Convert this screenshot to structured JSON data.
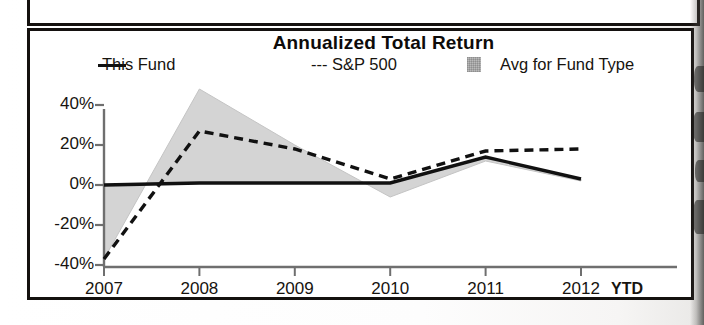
{
  "chart_data": {
    "type": "line",
    "title": "Annualized Total Return",
    "xlabel": "",
    "ylabel": "",
    "categories": [
      "2007",
      "2008",
      "2009",
      "2010",
      "2011",
      "2012"
    ],
    "last_category_note": "YTD",
    "ylim": [
      -40,
      50
    ],
    "yticks": [
      "40%",
      "20%",
      "0%",
      "-20%",
      "-40%"
    ],
    "ytick_values": [
      40,
      20,
      0,
      -20,
      -40
    ],
    "grid": false,
    "legend_position": "top",
    "series": [
      {
        "name": "This Fund",
        "style": "solid",
        "color": "#111111",
        "values": [
          0,
          1,
          1,
          1,
          14,
          3
        ]
      },
      {
        "name": "S&P 500",
        "style": "dashed",
        "color": "#111111",
        "values": [
          -37,
          27,
          18,
          3,
          17,
          18
        ]
      },
      {
        "name": "Avg for Fund Type",
        "style": "shaded-band",
        "color": "#d3d3d3",
        "values": [
          -37,
          48,
          20,
          -6,
          12,
          2
        ]
      }
    ],
    "band_baseline": [
      0,
      1,
      1,
      1,
      14,
      3
    ]
  },
  "legend": {
    "this_fund": "This Fund",
    "sp500": "--- S&P 500",
    "avg_fund_type": "Avg for Fund Type"
  },
  "axis": {
    "y_labels": [
      "40%",
      "20%",
      "0%",
      "-20%",
      "-40%"
    ],
    "x_labels": [
      "2007",
      "2008",
      "2009",
      "2010",
      "2011",
      "2012"
    ],
    "ytd_label": "YTD"
  }
}
